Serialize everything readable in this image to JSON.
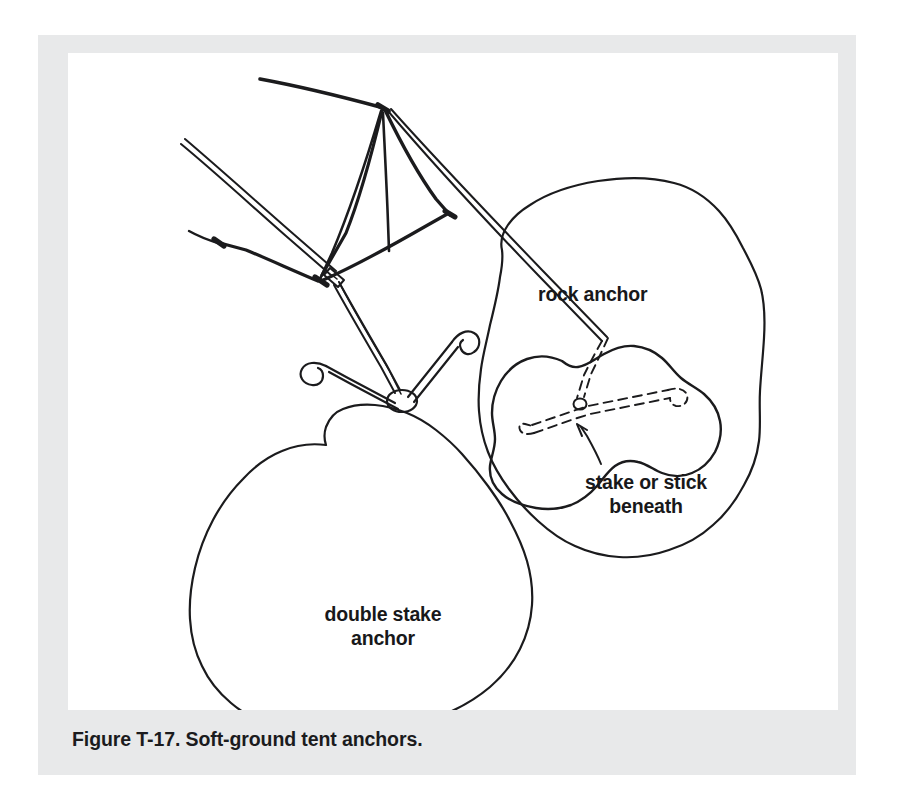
{
  "figure": {
    "caption": "Figure T-17. Soft-ground tent anchors.",
    "labels": {
      "rock_anchor": "rock anchor",
      "stake_or_stick_beneath": "stake or stick\nbeneath",
      "double_stake_anchor": "double stake\nanchor"
    },
    "colors": {
      "page_background": "#ffffff",
      "panel_background": "#e8e9ea",
      "plate_background": "#ffffff",
      "ink": "#1b1b1d",
      "caption_text": "#1b1b1d"
    },
    "elements": {
      "tent": "a-frame tent with ridge line, guy lines and ground stakes",
      "rock_anchor_patch": "irregular soft-ground patch containing a rock",
      "rock": "rock with guy line looped beneath it",
      "buried_stake": "dashed stake or stick shown beneath the rock",
      "double_stake_patch": "irregular soft-ground patch with two hooked stakes",
      "tensioner": "guy line tensioner slider on the double stake guy line",
      "pointer_arrow": "curved arrow from stake-or-stick label to buried stake"
    }
  }
}
